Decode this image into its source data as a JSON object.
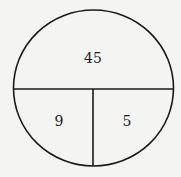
{
  "diagram": {
    "regions": [
      {
        "id": "top",
        "label": "45"
      },
      {
        "id": "bottom-left",
        "label": "9"
      },
      {
        "id": "bottom-right",
        "label": "5"
      }
    ],
    "colors": {
      "stroke": "#1a1a1a",
      "background": "#f4f4f2"
    }
  }
}
